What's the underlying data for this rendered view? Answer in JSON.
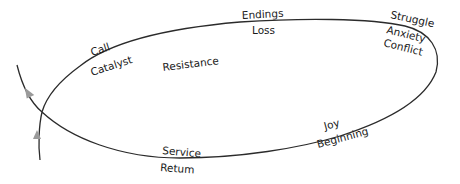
{
  "diagram": {
    "type": "cycle",
    "colors": {
      "line": "#2b2b2b",
      "arrow": "#9a9a9a",
      "text": "#1a1a1a",
      "background": "#ffffff"
    },
    "labels": {
      "call": "Call",
      "catalyst": "Catalyst",
      "resistance": "Resistance",
      "endings": "Endings",
      "loss": "Loss",
      "struggle": "Struggle",
      "anxiety": "Anxiety",
      "conflict": "Conflict",
      "joy": "Joy",
      "beginning": "Beginning",
      "service": "Service",
      "return": "Retum"
    },
    "arrows": [
      {
        "name": "upper-arrow",
        "direction": "up-left"
      },
      {
        "name": "lower-arrow",
        "direction": "up"
      }
    ]
  }
}
